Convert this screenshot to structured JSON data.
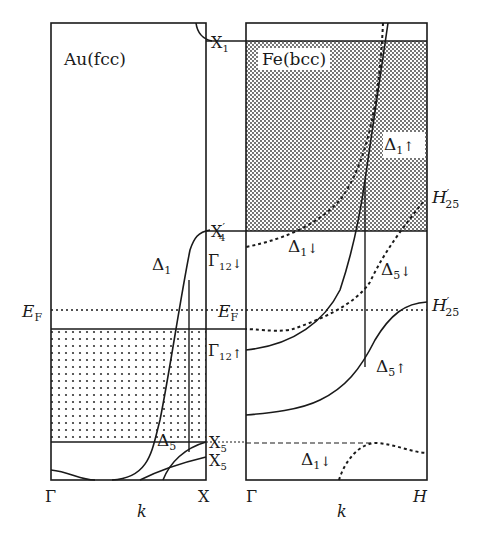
{
  "figure": {
    "left_panel": {
      "title": "Au(fcc)",
      "x_start": "Γ",
      "x_end": "X",
      "x_axis": "k",
      "labels": {
        "fermi": "E",
        "fermi_sub": "F",
        "band_delta1": "Δ",
        "band_delta1_sub": "1",
        "band_delta5": "Δ",
        "band_delta5_sub": "5"
      }
    },
    "middle_labels": {
      "x1": "X",
      "x1_sub": "1",
      "x4p": "X",
      "x4p_sub": "4",
      "x4p_prime": "′",
      "g12_down": "Γ",
      "g12_down_sub": "12",
      "g12_down_arrow": "↓",
      "fermi": "E",
      "fermi_sub": "F",
      "g12_up": "Γ",
      "g12_up_sub": "12",
      "g12_up_arrow": "↑",
      "x5_a": "X",
      "x5_a_sub": "5",
      "x5_b": "X",
      "x5_b_sub": "5"
    },
    "right_panel": {
      "title": "Fe(bcc)",
      "x_start": "Γ",
      "x_end": "H",
      "x_axis": "k",
      "labels": {
        "d1_up": "Δ",
        "d1_up_sub": "1",
        "d1_up_arrow": "↑",
        "h25_top": "H",
        "h25_top_sub": "25",
        "h25_top_prime": "′",
        "d1_down_top": "Δ",
        "d1_down_top_sub": "1",
        "d1_down_top_arrow": "↓",
        "d5_down": "Δ",
        "d5_down_sub": "5",
        "d5_down_arrow": "↓",
        "h25_mid": "H",
        "h25_mid_sub": "25",
        "h25_mid_prime": "′",
        "d5_up": "Δ",
        "d5_up_sub": "5",
        "d5_up_arrow": "↑",
        "d1_down_bottom": "Δ",
        "d1_down_bottom_sub": "1",
        "d1_down_bottom_arrow": "↓"
      }
    },
    "colors": {
      "line": "#1a1a1a",
      "background": "#ffffff",
      "dots": "#333333"
    }
  }
}
